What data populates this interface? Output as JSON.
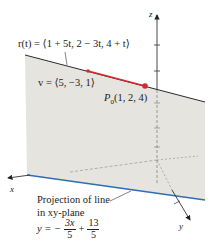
{
  "figure": {
    "line_equation": "r(t) = ⟨1 + 5t, 2 − 3t, 4 + t⟩",
    "direction_vector": "v = ⟨5, −3, 1⟩",
    "point_label": "P",
    "point_subscript": "0",
    "point_coords": "(1, 2, 4)",
    "projection_caption_line1": "Projection of line",
    "projection_caption_line2": "in xy-plane",
    "projection_eq_lhs": "y = −",
    "projection_eq_frac1_num": "3x",
    "projection_eq_frac1_den": "5",
    "projection_eq_plus": "+",
    "projection_eq_frac2_num": "13",
    "projection_eq_frac2_den": "5",
    "axis_x": "x",
    "axis_y": "y",
    "axis_z": "z"
  },
  "colors": {
    "plane_fill": "#e6e4de",
    "line": "#2b2b2b",
    "vector": "#d8282f",
    "projection": "#2f6db4",
    "axis": "#333333"
  }
}
